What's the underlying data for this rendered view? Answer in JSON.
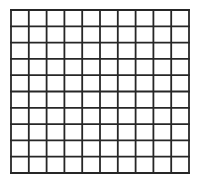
{
  "grid": {
    "rows": 10,
    "cols": 10,
    "x": 10,
    "y": 9,
    "width": 178,
    "height": 163,
    "line_color": "#262626",
    "line_width": 1.8,
    "background": "#ffffff"
  }
}
